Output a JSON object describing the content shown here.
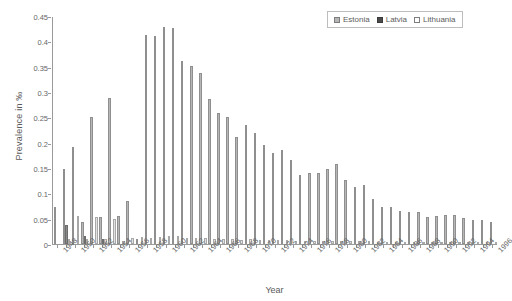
{
  "chart_data": {
    "type": "bar",
    "title": "",
    "subtitle": "",
    "xlabel": "Year",
    "ylabel": "Prevalence in ‰",
    "ylim": [
      0,
      0.45
    ],
    "ytick_values": [
      0,
      0.05,
      0.1,
      0.15,
      0.2,
      0.25,
      0.3,
      0.35,
      0.4,
      0.45
    ],
    "ytick_labels": [
      "0",
      "0.05",
      "0.1",
      "0.15",
      "0.2",
      "0.25",
      "0.3",
      "0.35",
      "0.4",
      "0.45"
    ],
    "grid": false,
    "legend_position": "top-right",
    "legend": [
      "Estonia",
      "Latvia",
      "Lithuania"
    ],
    "categories": [
      "1948",
      "1949",
      "1950",
      "1951",
      "1952",
      "1953",
      "1954",
      "1955",
      "1956",
      "1957",
      "1958",
      "1959",
      "1960",
      "1961",
      "1962",
      "1963",
      "1964",
      "1965",
      "1966",
      "1967",
      "1968",
      "1969",
      "1970",
      "1971",
      "1972",
      "1973",
      "1974",
      "1975",
      "1976",
      "1977",
      "1978",
      "1979",
      "1980",
      "1981",
      "1982",
      "1983",
      "1984",
      "1985",
      "1986",
      "1987",
      "1988",
      "1989",
      "1990",
      "1991",
      "1992",
      "1993",
      "1994",
      "1995",
      "1996"
    ],
    "xtick_labels": [
      "1948",
      "1950",
      "1952",
      "1954",
      "1956",
      "1958",
      "1960",
      "1962",
      "1964",
      "1966",
      "1968",
      "1970",
      "1972",
      "1974",
      "1976",
      "1978",
      "1980",
      "1982",
      "1984",
      "1986",
      "1988",
      "1990",
      "1992",
      "1994",
      "1996"
    ],
    "series": [
      {
        "name": "Estonia",
        "color": "#b6b6b6",
        "values": [
          0.073,
          0.148,
          0.192,
          0.044,
          0.25,
          0.054,
          0.289,
          0.055,
          0.085,
          0.01,
          0.412,
          0.411,
          0.428,
          0.427,
          0.362,
          0.352,
          0.338,
          0.286,
          0.258,
          0.251,
          0.212,
          0.234,
          0.219,
          0.196,
          0.179,
          0.186,
          0.166,
          0.137,
          0.14,
          0.14,
          0.148,
          0.158,
          0.126,
          0.112,
          0.117,
          0.089,
          0.073,
          0.074,
          0.066,
          0.063,
          0.064,
          0.053,
          0.055,
          0.057,
          0.058,
          0.051,
          0.047,
          0.048,
          0.044
        ]
      },
      {
        "name": "Latvia",
        "color": "#4a4a4a",
        "values": [
          0.0,
          0.038,
          0.0,
          0.016,
          0.0,
          0.01,
          0.0,
          0.0,
          0.0,
          0.0,
          0.0,
          0.0,
          0.0,
          0.0,
          0.0,
          0.0,
          0.0,
          0.0,
          0.0,
          0.0,
          0.0,
          0.0,
          0.0,
          0.0,
          0.0,
          0.0,
          0.0,
          0.0,
          0.0,
          0.0,
          0.0,
          0.0,
          0.0,
          0.0,
          0.0,
          0.0,
          0.0,
          0.0,
          0.0,
          0.0,
          0.0,
          0.0,
          0.0,
          0.0,
          0.0,
          0.0,
          0.0,
          0.0,
          0.0
        ]
      },
      {
        "name": "Lithuania",
        "color": "#e2e2e2",
        "values": [
          0.0,
          0.01,
          0.055,
          0.009,
          0.053,
          0.01,
          0.049,
          0.006,
          0.012,
          0.014,
          0.012,
          0.014,
          0.015,
          0.016,
          0.012,
          0.011,
          0.012,
          0.01,
          0.009,
          0.01,
          0.008,
          0.009,
          0.008,
          0.007,
          0.008,
          0.007,
          0.006,
          0.006,
          0.006,
          0.005,
          0.006,
          0.006,
          0.005,
          0.005,
          0.005,
          0.004,
          0.004,
          0.004,
          0.004,
          0.003,
          0.003,
          0.003,
          0.003,
          0.003,
          0.003,
          0.003,
          0.002,
          0.003,
          0.002
        ]
      }
    ]
  }
}
